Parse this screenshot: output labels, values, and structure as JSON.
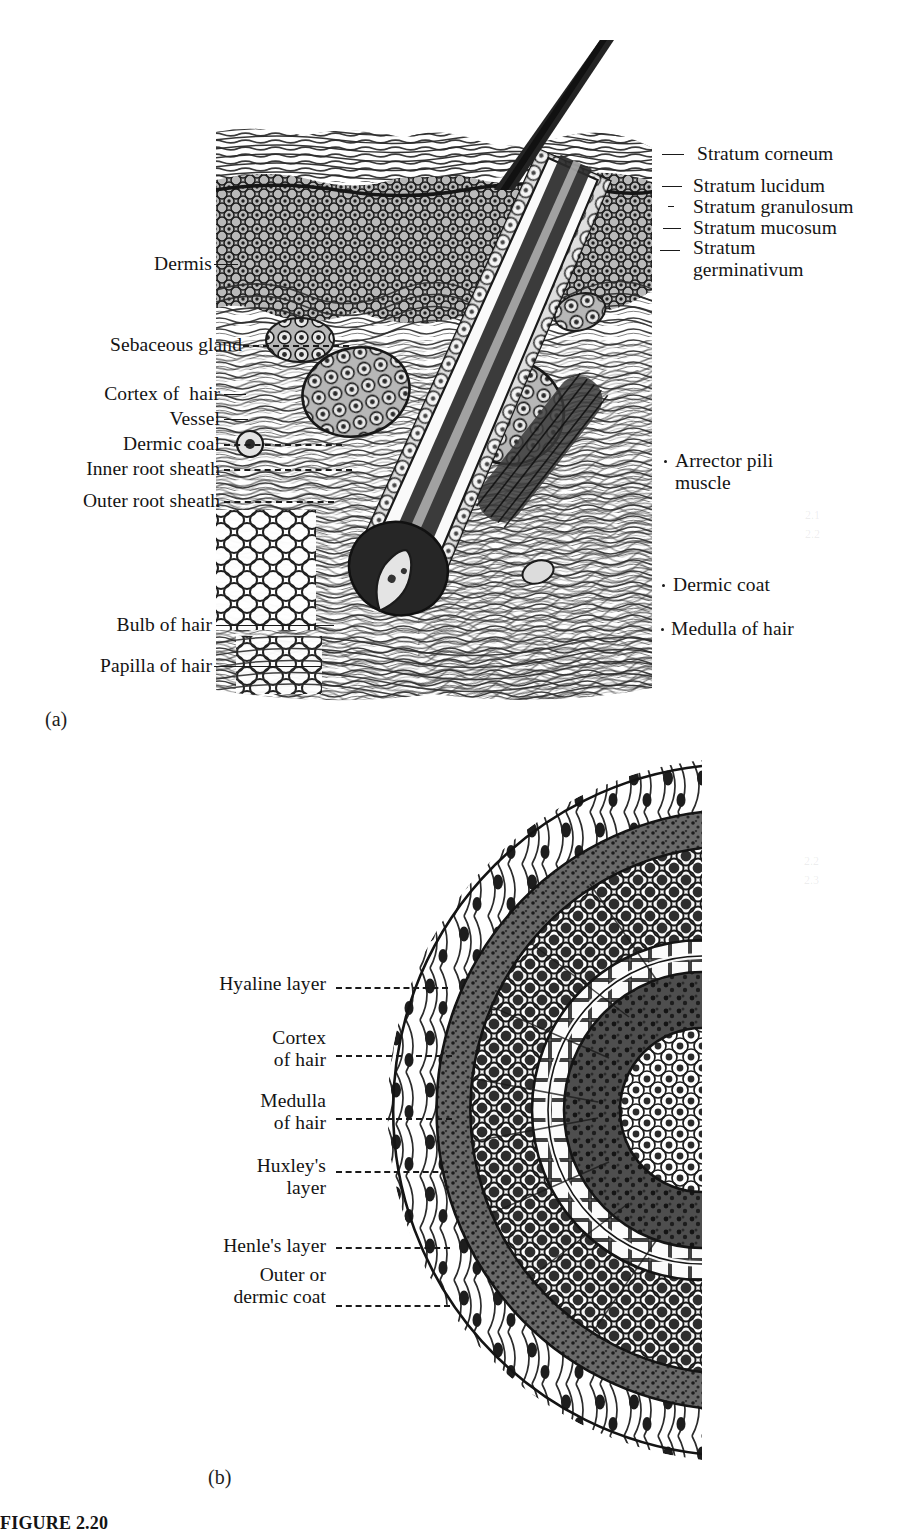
{
  "figure": {
    "caption": "FIGURE 2.20",
    "panel_a_caption": "(a)",
    "panel_b_caption": "(b)"
  },
  "panel_a": {
    "name": "longitudinal-section-of-skin-and-hair-follicle",
    "labels_left": [
      {
        "id": "dermis",
        "text": "Dermis"
      },
      {
        "id": "sebaceous-gland",
        "text": "Sebaceous gland"
      },
      {
        "id": "cortex-of-hair",
        "text": "Cortex of  hair"
      },
      {
        "id": "vessel",
        "text": "Vessel"
      },
      {
        "id": "dermic-coal",
        "text": "Dermic coal"
      },
      {
        "id": "inner-root-sheath",
        "text": "Inner root sheath"
      },
      {
        "id": "outer-root-sheath",
        "text": "Outer root sheath"
      },
      {
        "id": "bulb-of-hair",
        "text": "Bulb of hair"
      },
      {
        "id": "papilla-of-hair",
        "text": "Papilla of hair"
      }
    ],
    "labels_right": [
      {
        "id": "stratum-corneum",
        "text": "Stratum corneum"
      },
      {
        "id": "stratum-lucidum",
        "text": "Stratum lucidum"
      },
      {
        "id": "stratum-granulosum",
        "text": "Stratum granulosum"
      },
      {
        "id": "stratum-mucosum",
        "text": "Stratum mucosum"
      },
      {
        "id": "stratum-germinativum",
        "text": "Stratum\ngerminativum"
      },
      {
        "id": "arrector-pili-muscle",
        "text": "Arrector pili\nmuscle"
      },
      {
        "id": "dermic-coat",
        "text": "Dermic coat"
      },
      {
        "id": "medulla-of-hair",
        "text": "Medulla of hair"
      }
    ]
  },
  "panel_b": {
    "name": "transverse-section-of-hair-follicle",
    "labels_left": [
      {
        "id": "hyaline-layer",
        "text": "Hyaline layer"
      },
      {
        "id": "cortex-of-hair-b",
        "text": "Cortex\nof hair"
      },
      {
        "id": "medulla-of-hair-b",
        "text": "Medulla\nof hair"
      },
      {
        "id": "huxleys-layer",
        "text": "Huxley's\nlayer"
      },
      {
        "id": "henles-layer",
        "text": "Henle's layer"
      },
      {
        "id": "outer-or-dermic-coat",
        "text": "Outer or\ndermic coat"
      }
    ]
  },
  "colors": {
    "ink": "#1a1a1a",
    "page": "#ffffff",
    "mid_tone": "#5a5a5a",
    "light_tone": "#9a9a9a"
  },
  "ghost_marks": [
    {
      "id": "ghost-a",
      "text": "2.1\n2.2"
    },
    {
      "id": "ghost-b",
      "text": "2.2\n2.3"
    }
  ]
}
